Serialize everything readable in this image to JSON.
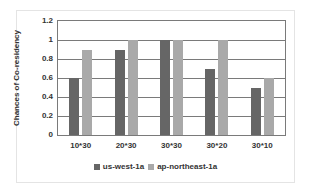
{
  "chart_data": {
    "type": "bar",
    "title": "",
    "xlabel": "",
    "ylabel": "Chances of Co-residency",
    "categories": [
      "10*30",
      "20*30",
      "30*30",
      "30*20",
      "30*10"
    ],
    "series": [
      {
        "name": "us-west-1a",
        "color": "#666666",
        "values": [
          0.6,
          0.9,
          1.0,
          0.7,
          0.5
        ]
      },
      {
        "name": "ap-northeast-1a",
        "color": "#a9a9a9",
        "values": [
          0.9,
          1.0,
          1.0,
          1.0,
          0.6
        ]
      }
    ],
    "ylim": [
      0,
      1.2
    ],
    "yticks": [
      "0",
      "0.2",
      "0.4",
      "0.6",
      "0.8",
      "1",
      "1.2"
    ],
    "grid": true,
    "legend_position": "bottom"
  }
}
